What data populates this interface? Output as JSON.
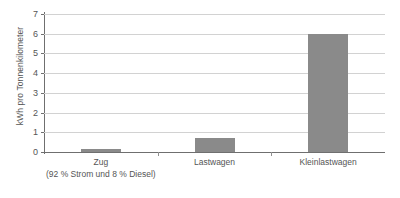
{
  "chart_data": {
    "type": "bar",
    "title": "",
    "subtitle": "",
    "xlabel": "",
    "ylabel": "kWh pro Tonnenkilometer",
    "categories": [
      "Zug",
      "Lastwagen",
      "Kleinlastwagen"
    ],
    "category_sublabels": [
      "(92 % Strom und 8 % Diesel)",
      "",
      ""
    ],
    "values": [
      0.15,
      0.7,
      6.0
    ],
    "series": [
      {
        "name": "kWh pro Tonnenkilometer",
        "values": [
          0.15,
          0.7,
          6.0
        ]
      }
    ],
    "ylim": [
      0,
      7
    ],
    "yticks": [
      0,
      1,
      2,
      3,
      4,
      5,
      6,
      7
    ],
    "ytick_labels": [
      "0",
      "1",
      "2",
      "3",
      "4",
      "5",
      "6",
      "7"
    ],
    "grid": true,
    "grid_axis": "y",
    "legend": false,
    "legend_position": "none",
    "bar_color": "#8a8a8a",
    "gridline_color": "#d2d2d2",
    "axis_color": "#6f6f6f",
    "text_color": "#555555",
    "background_color": "#ffffff"
  }
}
